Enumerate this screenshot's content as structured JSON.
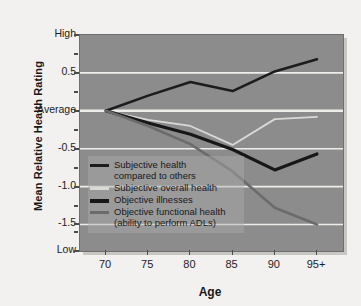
{
  "chart_data": {
    "type": "line",
    "title": "",
    "xlabel": "Age",
    "ylabel": "Mean Relative Health Rating",
    "x": [
      "70",
      "75",
      "80",
      "85",
      "90",
      "95+"
    ],
    "categories": [
      "70",
      "75",
      "80",
      "85",
      "90",
      "95+"
    ],
    "xtick_labels": [
      "70",
      "75",
      "80",
      "85",
      "90",
      "95+"
    ],
    "ytick_labels": [
      "High",
      "0.5",
      "Average",
      "-0.5",
      "-1.0",
      "-1.5",
      "Low"
    ],
    "ytick_values": [
      1.0,
      0.5,
      0.0,
      -0.5,
      -1.0,
      -1.5,
      -1.85
    ],
    "ylim": [
      -1.85,
      1.0
    ],
    "grid": true,
    "legend_position": "inside-lower-left",
    "series": [
      {
        "name": "Subjective health compared to others",
        "color": "#1c1c1e",
        "width": 2.6,
        "values": [
          0.0,
          0.2,
          0.38,
          0.26,
          0.52,
          0.68
        ]
      },
      {
        "name": "Subjective overall health",
        "color": "#d9d9d6",
        "width": 1.8,
        "values": [
          0.0,
          -0.12,
          -0.2,
          -0.45,
          -0.11,
          -0.08
        ]
      },
      {
        "name": "Objective illnesses",
        "color": "#17171a",
        "width": 3.2,
        "values": [
          0.0,
          -0.16,
          -0.31,
          -0.51,
          -0.78,
          -0.57
        ]
      },
      {
        "name": "Objective functional health (ability to perform ADLs)",
        "color": "#6b6b6b",
        "width": 2.6,
        "values": [
          0.0,
          -0.2,
          -0.44,
          -0.8,
          -1.28,
          -1.5
        ]
      }
    ]
  },
  "axes": {
    "y_title": "Mean Relative Health Rating",
    "x_title": "Age"
  },
  "legend": {
    "items": [
      {
        "label": "Subjective health\ncompared to others",
        "swatch_name": "legend-swatch-subjective-compared",
        "color": "#1c1c1e",
        "thick": false
      },
      {
        "label": "Subjective overall health",
        "swatch_name": "legend-swatch-subjective-overall",
        "color": "#d9d9d6",
        "thick": false
      },
      {
        "label": "Objective illnesses",
        "swatch_name": "legend-swatch-objective-illnesses",
        "color": "#17171a",
        "thick": true
      },
      {
        "label": "Objective functional health\n(ability to perform ADLs)",
        "swatch_name": "legend-swatch-objective-functional",
        "color": "#6b6b6b",
        "thick": false
      }
    ]
  },
  "colors": {
    "page_background": "#f2f1ef",
    "plot_background": "#8c8c8c",
    "gridline": "#ededea",
    "axis_text": "#1b1b1e"
  }
}
